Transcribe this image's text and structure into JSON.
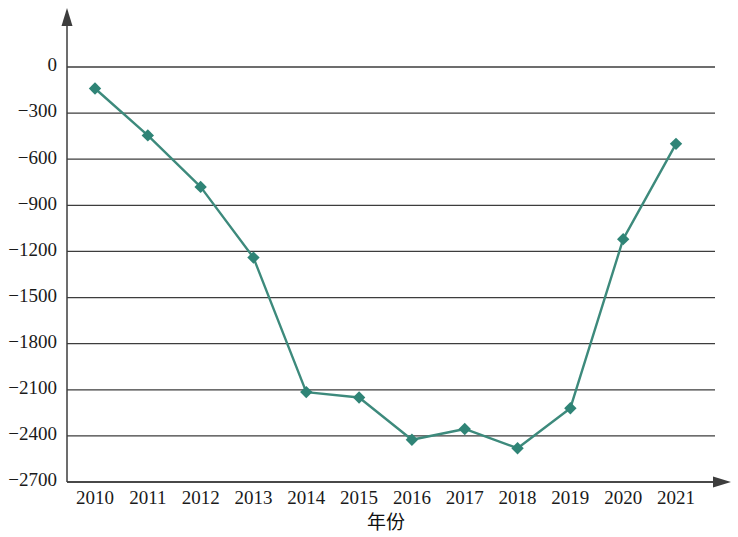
{
  "chart_data": {
    "type": "line",
    "title": "",
    "subtitle": "",
    "xlabel": "年份",
    "ylabel": "",
    "categories": [
      "2010",
      "2011",
      "2012",
      "2013",
      "2014",
      "2015",
      "2016",
      "2017",
      "2018",
      "2019",
      "2020",
      "2021"
    ],
    "values": [
      -140,
      -445,
      -780,
      -1240,
      -2115,
      -2150,
      -2425,
      -2355,
      -2480,
      -2220,
      -1120,
      -500
    ],
    "series": [
      {
        "name": "",
        "values": [
          -140,
          -445,
          -780,
          -1240,
          -2115,
          -2150,
          -2425,
          -2355,
          -2480,
          -2220,
          -1120,
          -500
        ]
      }
    ],
    "ylim": [
      -2700,
      0
    ],
    "ytick_values": [
      0,
      -300,
      -600,
      -900,
      -1200,
      -1500,
      -1800,
      -2100,
      -2400,
      -2700
    ],
    "ytick_labels": [
      "0",
      "−300",
      "−600",
      "−900",
      "−1200",
      "−1500",
      "−1800",
      "−2100",
      "−2400",
      "−2700"
    ],
    "xtick_labels": [
      "2010",
      "2011",
      "2012",
      "2013",
      "2014",
      "2015",
      "2016",
      "2017",
      "2018",
      "2019",
      "2020",
      "2021"
    ],
    "grid": "horizontal",
    "legend": "none",
    "marker": "diamond",
    "colors": {
      "series": "#3d8a7c",
      "marker": "#2f8476",
      "grid": "#3d3d3d",
      "axis": "#3d3d3d",
      "text": "#1a1a1a",
      "background": "#ffffff"
    }
  },
  "axes": {
    "x_axis_arrow": "arrow-right",
    "y_axis_arrow": "arrow-up"
  }
}
